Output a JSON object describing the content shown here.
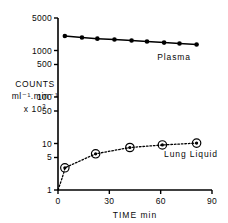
{
  "chart_data": {
    "type": "line",
    "title": "",
    "xlabel": "TIME min",
    "ylabel_lines": [
      "COUNTS",
      "ml⁻¹.min⁻¹",
      "x 10"
    ],
    "ylabel_exponent": "3",
    "yscale": "log",
    "xscale": "linear",
    "xlim": [
      0,
      90
    ],
    "ylim": [
      1,
      5000
    ],
    "grid": false,
    "legend_position": "inline-annotation",
    "xticks": [
      0,
      30,
      60,
      90
    ],
    "xtick_labels": [
      "0",
      "30",
      "60",
      "90"
    ],
    "yticks": [
      1,
      5,
      10,
      50,
      100,
      500,
      1000,
      5000
    ],
    "ytick_labels": [
      "1",
      "5",
      "10",
      "50",
      "100",
      "500",
      "1000",
      "5000"
    ],
    "series": [
      {
        "name": "Plasma",
        "marker": "filled-circle",
        "linestyle": "solid",
        "color": "#000000",
        "x": [
          4,
          14,
          23,
          33,
          43,
          52,
          62,
          71,
          81
        ],
        "values": [
          2050,
          1900,
          1800,
          1720,
          1640,
          1560,
          1480,
          1410,
          1350
        ]
      },
      {
        "name": "Lung Liquid",
        "marker": "dot-in-circle",
        "linestyle": "dotted",
        "color": "#000000",
        "x": [
          4,
          22,
          42,
          61,
          81
        ],
        "values": [
          3.0,
          6.0,
          8.2,
          9.3,
          10.2
        ]
      }
    ],
    "annotations": [
      {
        "text": "Plasma",
        "x": 58,
        "y": 700
      },
      {
        "text": "Lung Liquid",
        "x": 62,
        "y": 5.6
      }
    ]
  },
  "axis": {
    "x_title": "TIME min"
  }
}
